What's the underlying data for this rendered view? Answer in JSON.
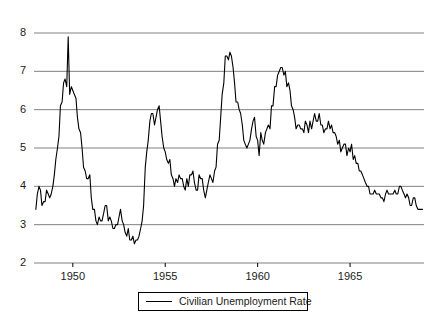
{
  "chart_data": {
    "type": "line",
    "title": "",
    "subtitle": "",
    "xlabel": "",
    "ylabel": "",
    "xlim": [
      1947.9,
      1969.0
    ],
    "ylim": [
      2,
      8
    ],
    "grid": true,
    "grid_axis": "y",
    "legend_position": "bottom-center",
    "y_ticks": [
      8,
      7,
      6,
      5,
      4,
      3,
      2
    ],
    "x_ticks": [
      1950,
      1955,
      1960,
      1965
    ],
    "x_tick_labels": [
      "1950",
      "1955",
      "1960",
      "1965"
    ],
    "y_tick_labels": [
      "8",
      "7",
      "6",
      "5",
      "4",
      "3",
      "2"
    ],
    "series": [
      {
        "name": "Civilian Unemployment Rate",
        "color": "#000000",
        "units": "percent",
        "frequency": "monthly",
        "x": [
          1948.0,
          1948.08,
          1948.17,
          1948.25,
          1948.33,
          1948.42,
          1948.5,
          1948.58,
          1948.67,
          1948.75,
          1948.83,
          1948.92,
          1949.0,
          1949.08,
          1949.17,
          1949.25,
          1949.33,
          1949.42,
          1949.5,
          1949.58,
          1949.67,
          1949.75,
          1949.83,
          1949.92,
          1950.0,
          1950.08,
          1950.17,
          1950.25,
          1950.33,
          1950.42,
          1950.5,
          1950.58,
          1950.67,
          1950.75,
          1950.83,
          1950.92,
          1951.0,
          1951.08,
          1951.17,
          1951.25,
          1951.33,
          1951.42,
          1951.5,
          1951.58,
          1951.67,
          1951.75,
          1951.83,
          1951.92,
          1952.0,
          1952.08,
          1952.17,
          1952.25,
          1952.33,
          1952.42,
          1952.5,
          1952.58,
          1952.67,
          1952.75,
          1952.83,
          1952.92,
          1953.0,
          1953.08,
          1953.17,
          1953.25,
          1953.33,
          1953.42,
          1953.5,
          1953.58,
          1953.67,
          1953.75,
          1953.83,
          1953.92,
          1954.0,
          1954.08,
          1954.17,
          1954.25,
          1954.33,
          1954.42,
          1954.5,
          1954.58,
          1954.67,
          1954.75,
          1954.83,
          1954.92,
          1955.0,
          1955.08,
          1955.17,
          1955.25,
          1955.33,
          1955.42,
          1955.5,
          1955.58,
          1955.67,
          1955.75,
          1955.83,
          1955.92,
          1956.0,
          1956.08,
          1956.17,
          1956.25,
          1956.33,
          1956.42,
          1956.5,
          1956.58,
          1956.67,
          1956.75,
          1956.83,
          1956.92,
          1957.0,
          1957.08,
          1957.17,
          1957.25,
          1957.33,
          1957.42,
          1957.5,
          1957.58,
          1957.67,
          1957.75,
          1957.83,
          1957.92,
          1958.0,
          1958.08,
          1958.17,
          1958.25,
          1958.33,
          1958.42,
          1958.5,
          1958.58,
          1958.67,
          1958.75,
          1958.83,
          1958.92,
          1959.0,
          1959.08,
          1959.17,
          1959.25,
          1959.33,
          1959.42,
          1959.5,
          1959.58,
          1959.67,
          1959.75,
          1959.83,
          1959.92,
          1960.0,
          1960.08,
          1960.17,
          1960.25,
          1960.33,
          1960.42,
          1960.5,
          1960.58,
          1960.67,
          1960.75,
          1960.83,
          1960.92,
          1961.0,
          1961.08,
          1961.17,
          1961.25,
          1961.33,
          1961.42,
          1961.5,
          1961.58,
          1961.67,
          1961.75,
          1961.83,
          1961.92,
          1962.0,
          1962.08,
          1962.17,
          1962.25,
          1962.33,
          1962.42,
          1962.5,
          1962.58,
          1962.67,
          1962.75,
          1962.83,
          1962.92,
          1963.0,
          1963.08,
          1963.17,
          1963.25,
          1963.33,
          1963.42,
          1963.5,
          1963.58,
          1963.67,
          1963.75,
          1963.83,
          1963.92,
          1964.0,
          1964.08,
          1964.17,
          1964.25,
          1964.33,
          1964.42,
          1964.5,
          1964.58,
          1964.67,
          1964.75,
          1964.83,
          1964.92,
          1965.0,
          1965.08,
          1965.17,
          1965.25,
          1965.33,
          1965.42,
          1965.5,
          1965.58,
          1965.67,
          1965.75,
          1965.83,
          1965.92,
          1966.0,
          1966.08,
          1966.17,
          1966.25,
          1966.33,
          1966.42,
          1966.5,
          1966.58,
          1966.67,
          1966.75,
          1966.83,
          1966.92,
          1967.0,
          1967.08,
          1967.17,
          1967.25,
          1967.33,
          1967.42,
          1967.5,
          1967.58,
          1967.67,
          1967.75,
          1967.83,
          1967.92,
          1968.0,
          1968.08,
          1968.17,
          1968.25,
          1968.33,
          1968.42,
          1968.5,
          1968.58,
          1968.67,
          1968.75,
          1968.83,
          1968.92
        ],
        "values": [
          3.4,
          3.8,
          4.0,
          3.9,
          3.5,
          3.6,
          3.6,
          3.9,
          3.8,
          3.7,
          3.8,
          4.0,
          4.3,
          4.7,
          5.0,
          5.3,
          6.1,
          6.2,
          6.7,
          6.8,
          6.6,
          7.9,
          6.4,
          6.6,
          6.5,
          6.4,
          6.3,
          5.8,
          5.5,
          5.4,
          5.0,
          4.5,
          4.4,
          4.2,
          4.2,
          4.3,
          3.7,
          3.4,
          3.4,
          3.1,
          3.0,
          3.2,
          3.1,
          3.1,
          3.3,
          3.5,
          3.5,
          3.1,
          3.2,
          3.1,
          2.9,
          2.9,
          3.0,
          3.0,
          3.2,
          3.4,
          3.1,
          3.0,
          2.8,
          2.7,
          2.9,
          2.6,
          2.6,
          2.7,
          2.5,
          2.6,
          2.6,
          2.7,
          2.9,
          3.1,
          3.5,
          4.5,
          4.9,
          5.2,
          5.7,
          5.9,
          5.9,
          5.6,
          5.8,
          6.0,
          6.1,
          5.7,
          5.3,
          5.0,
          4.9,
          4.7,
          4.6,
          4.7,
          4.3,
          4.2,
          4.0,
          4.2,
          4.1,
          4.3,
          4.2,
          4.2,
          4.0,
          3.9,
          4.2,
          4.0,
          4.3,
          4.3,
          4.4,
          4.1,
          3.9,
          3.9,
          4.3,
          4.2,
          4.2,
          3.9,
          3.7,
          3.9,
          4.1,
          4.3,
          4.2,
          4.1,
          4.4,
          4.5,
          5.1,
          5.2,
          5.8,
          6.4,
          6.7,
          7.4,
          7.4,
          7.3,
          7.5,
          7.4,
          7.1,
          6.7,
          6.2,
          6.2,
          6.0,
          5.9,
          5.6,
          5.2,
          5.1,
          5.0,
          5.1,
          5.2,
          5.5,
          5.7,
          5.8,
          5.3,
          5.2,
          4.8,
          5.4,
          5.2,
          5.1,
          5.4,
          5.5,
          5.6,
          5.5,
          6.1,
          6.1,
          6.6,
          6.6,
          6.9,
          7.0,
          7.1,
          7.1,
          6.9,
          7.0,
          6.6,
          6.7,
          6.5,
          6.1,
          6.0,
          5.8,
          5.5,
          5.6,
          5.6,
          5.5,
          5.5,
          5.4,
          5.7,
          5.6,
          5.4,
          5.7,
          5.5,
          5.7,
          5.9,
          5.7,
          5.7,
          5.9,
          5.6,
          5.6,
          5.4,
          5.5,
          5.5,
          5.7,
          5.5,
          5.6,
          5.4,
          5.4,
          5.3,
          5.1,
          5.2,
          4.9,
          5.0,
          5.1,
          5.1,
          4.8,
          5.0,
          4.9,
          5.1,
          4.7,
          4.8,
          4.6,
          4.6,
          4.4,
          4.4,
          4.3,
          4.2,
          4.1,
          4.0,
          4.0,
          3.8,
          3.8,
          3.8,
          3.9,
          3.8,
          3.8,
          3.8,
          3.7,
          3.7,
          3.6,
          3.8,
          3.9,
          3.8,
          3.8,
          3.8,
          3.8,
          3.9,
          3.8,
          3.8,
          4.0,
          4.0,
          3.9,
          3.8,
          3.7,
          3.8,
          3.7,
          3.5,
          3.5,
          3.7,
          3.7,
          3.5,
          3.4,
          3.4,
          3.4,
          3.4
        ]
      }
    ]
  },
  "legend": {
    "entries": [
      {
        "label": "Civilian Unemployment Rate",
        "marker": "line-swatch",
        "color": "#000000"
      }
    ]
  },
  "axes": {
    "y_labels": [
      "8",
      "7",
      "6",
      "5",
      "4",
      "3",
      "2"
    ],
    "x_labels": [
      "1950",
      "1955",
      "1960",
      "1965"
    ]
  },
  "style": {
    "line_color": "#000000",
    "grid_color": "#808080",
    "axis_color": "#000000",
    "background": "#ffffff",
    "text_color": "#1a1a1a"
  }
}
